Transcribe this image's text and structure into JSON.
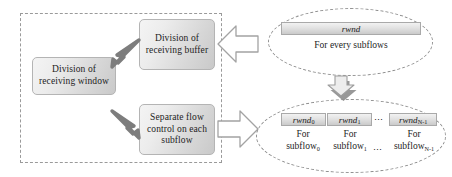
{
  "diagram": {
    "left_panel": {
      "boxes": [
        {
          "id": "recv-window",
          "label": "Division of\nreceiving window"
        },
        {
          "id": "recv-buffer",
          "label": "Division of\nreceiving buffer"
        },
        {
          "id": "flow-control",
          "label": "Separate flow\ncontrol on each\nsubflow"
        }
      ],
      "box_labels": {
        "recv_window_line1": "Division of",
        "recv_window_line2": "receiving window",
        "recv_buffer_line1": "Division of",
        "recv_buffer_line2": "receiving buffer",
        "flow_control_line1": "Separate flow",
        "flow_control_line2": "control on each",
        "flow_control_line3": "subflow"
      },
      "arrows": [
        {
          "id": "arrow-to-window-upper",
          "direction": "left-down",
          "style": "solid-gray"
        },
        {
          "id": "arrow-to-flowcontrol",
          "direction": "right-down",
          "style": "solid-gray"
        }
      ]
    },
    "connectors": [
      {
        "id": "block-arrow-upper",
        "direction": "left",
        "style": "hollow-block"
      },
      {
        "id": "block-arrow-lower",
        "direction": "right",
        "style": "hollow-block"
      },
      {
        "id": "block-arrow-down",
        "direction": "down",
        "style": "hollow-block-shadow"
      }
    ],
    "right_panel": {
      "top_group": {
        "chip": "rwnd",
        "caption": "For every subflows"
      },
      "bottom_group": {
        "chips": [
          {
            "base": "rwnd",
            "sub": "0"
          },
          {
            "base": "rwnd",
            "sub": "1"
          },
          {
            "base": "rwnd",
            "sub": "N-1"
          }
        ],
        "ellipsis": "⋯",
        "captions": [
          {
            "line1": "For",
            "base": "subflow",
            "sub": "0"
          },
          {
            "line1": "For",
            "base": "subflow",
            "sub": "1"
          },
          {
            "line1": "For",
            "base": "subflow",
            "sub": "N-1"
          }
        ]
      }
    },
    "colors": {
      "box_border": "#b4b4b4",
      "box_fill_light": "#f4f4f4",
      "box_fill_dark": "#c9c9c9",
      "dashed_border": "#9a9a9a",
      "gray_arrow": "#808080",
      "block_arrow_stroke": "#9a9a9a",
      "text": "#1d1d1d",
      "background": "#ffffff"
    }
  }
}
